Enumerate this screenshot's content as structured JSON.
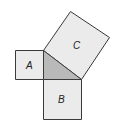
{
  "diagram": {
    "shapes": [
      {
        "id": "A",
        "label": "A",
        "kind": "square on leg"
      },
      {
        "id": "B",
        "label": "B",
        "kind": "square on leg"
      },
      {
        "id": "C",
        "label": "C",
        "kind": "square on hypotenuse"
      },
      {
        "id": "triangle",
        "label": "",
        "kind": "right triangle (shaded)"
      }
    ],
    "colors": {
      "square_fill": "#ebebeb",
      "triangle_fill": "#b9b9b9",
      "stroke": "#3a3a3a"
    }
  }
}
